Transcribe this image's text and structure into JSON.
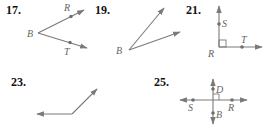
{
  "colors": {
    "ray": "#7a7a7a",
    "label": "#666666",
    "number": "#111111",
    "background": "#ffffff"
  },
  "figures": [
    {
      "number": "17.",
      "description": "Angle RBT with vertex B, rays through R and T",
      "labels": {
        "vertex": "B",
        "ray1_point": "R",
        "ray2_point": "T"
      }
    },
    {
      "number": "19.",
      "description": "Acute angle with vertex B, two unlabeled rays",
      "labels": {
        "vertex": "B"
      }
    },
    {
      "number": "21.",
      "description": "Right angle SRT with vertex R and right-angle mark",
      "labels": {
        "vertex": "R",
        "ray1_point": "S",
        "ray2_point": "T"
      }
    },
    {
      "number": "23.",
      "description": "Obtuse angle, unlabeled, one ray left and one ray up-right",
      "labels": {}
    },
    {
      "number": "25.",
      "description": "Two perpendicular lines with points D, S, R, B and right-angle mark",
      "labels": {
        "top": "D",
        "left": "S",
        "right": "R",
        "bottom": "B"
      }
    }
  ]
}
